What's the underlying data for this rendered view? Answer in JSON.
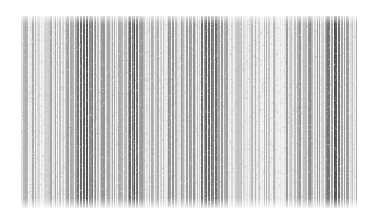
{
  "image": {
    "description": "grayscale vertical stripe texture (barcode-like scan)",
    "background": "#ffffff",
    "region": {
      "x": 21,
      "y": 16,
      "width": 336,
      "height": 192
    },
    "stripe_count": 260,
    "dark_bands_at_fraction": [
      0.18,
      0.33,
      0.56,
      0.94
    ],
    "light_band_at_fraction": [
      0.62,
      0.78
    ],
    "ink_color": "#3a3a3a"
  }
}
